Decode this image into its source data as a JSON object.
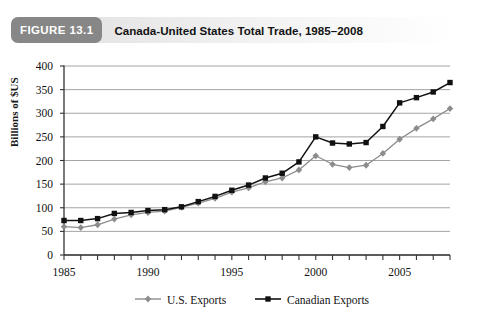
{
  "figure": {
    "badge": "FIGURE 13.1",
    "title": "Canada-United States Total Trade, 1985–2008"
  },
  "colors": {
    "badge_bg": "#878787",
    "us_exports": "#8c8c8c",
    "canadian_exports": "#111111",
    "gridline": "#9a9a9a",
    "axis": "#333333"
  },
  "chart_data": {
    "type": "line",
    "title": "Canada-United States Total Trade, 1985–2008",
    "xlabel": "",
    "ylabel": "Billions of $US",
    "xlim": [
      1985,
      2008
    ],
    "ylim": [
      0,
      400
    ],
    "ytick_step": 50,
    "yticks": [
      0,
      50,
      100,
      150,
      200,
      250,
      300,
      350,
      400
    ],
    "xticks_labeled": [
      1985,
      1990,
      1995,
      2000,
      2005
    ],
    "xticks_all": [
      1985,
      1986,
      1987,
      1988,
      1989,
      1990,
      1991,
      1992,
      1993,
      1994,
      1995,
      1996,
      1997,
      1998,
      1999,
      2000,
      2001,
      2002,
      2003,
      2004,
      2005,
      2006,
      2007,
      2008
    ],
    "grid": "horizontal",
    "legend_position": "bottom",
    "x": [
      1985,
      1986,
      1987,
      1988,
      1989,
      1990,
      1991,
      1992,
      1993,
      1994,
      1995,
      1996,
      1997,
      1998,
      1999,
      2000,
      2001,
      2002,
      2003,
      2004,
      2005,
      2006,
      2007,
      2008
    ],
    "series": [
      {
        "name": "U.S. Exports",
        "marker": "diamond",
        "color": "#8c8c8c",
        "values": [
          60,
          58,
          64,
          76,
          85,
          90,
          93,
          101,
          110,
          120,
          133,
          142,
          155,
          163,
          180,
          210,
          192,
          185,
          190,
          215,
          245,
          268,
          288,
          310
        ]
      },
      {
        "name": "Canadian Exports",
        "marker": "square",
        "color": "#111111",
        "values": [
          73,
          73,
          77,
          88,
          90,
          94,
          96,
          102,
          113,
          124,
          137,
          148,
          163,
          173,
          197,
          250,
          237,
          235,
          238,
          272,
          322,
          333,
          345,
          365
        ]
      }
    ]
  },
  "legend": {
    "items": [
      {
        "label": "U.S. Exports",
        "marker": "diamond-icon"
      },
      {
        "label": "Canadian Exports",
        "marker": "square-icon"
      }
    ]
  },
  "axis": {
    "y_title": "Billions of $US"
  }
}
